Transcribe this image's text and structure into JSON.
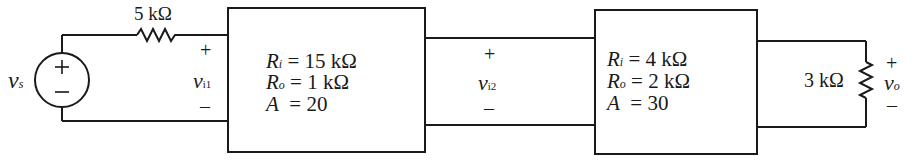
{
  "source": {
    "label": "v",
    "sub": "s",
    "plus": "+",
    "minus": "–"
  },
  "series_resistor": {
    "label": "5 kΩ"
  },
  "port1": {
    "plus": "+",
    "label": "v",
    "sub": "i1",
    "minus": "–"
  },
  "stage1": {
    "ri": {
      "sym": "R",
      "sub": "i",
      "eq": "= 15 kΩ"
    },
    "ro": {
      "sym": "R",
      "sub": "o",
      "eq": "= 1 kΩ"
    },
    "a": {
      "sym": "A",
      "eq": "= 20"
    }
  },
  "port2": {
    "plus": "+",
    "label": "v",
    "sub": "i2",
    "minus": "–"
  },
  "stage2": {
    "ri": {
      "sym": "R",
      "sub": "i",
      "eq": "= 4 kΩ"
    },
    "ro": {
      "sym": "R",
      "sub": "o",
      "eq": "= 2 kΩ"
    },
    "a": {
      "sym": "A",
      "eq": "= 30"
    }
  },
  "load": {
    "label": "3 kΩ"
  },
  "output": {
    "plus": "+",
    "label": "v",
    "sub": "o",
    "minus": "–"
  }
}
